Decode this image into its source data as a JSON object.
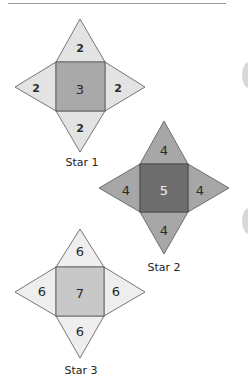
{
  "colors": {
    "star1_point": "#e3e3e3",
    "star1_center": "#a9a9a9",
    "star2_point": "#a7a7a7",
    "star2_center": "#6e6e6e",
    "star3_point": "#eeeeee",
    "star3_center": "#c8c8c8",
    "stroke": "#555555"
  },
  "stars": [
    {
      "label": "Star 1",
      "center_value": "3",
      "top": "2",
      "left": "2",
      "right": "2",
      "bottom": "2"
    },
    {
      "label": "Star 2",
      "center_value": "5",
      "top": "4",
      "left": "4",
      "right": "4",
      "bottom": "4"
    },
    {
      "label": "Star 3",
      "center_value": "7",
      "top": "6",
      "left": "6",
      "right": "6",
      "bottom": "6"
    }
  ]
}
